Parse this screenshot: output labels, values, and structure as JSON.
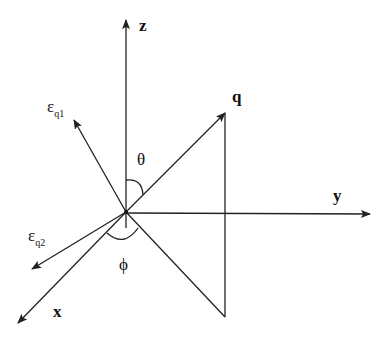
{
  "diagram": {
    "type": "3d-coordinate-vector-diagram",
    "axes": [
      {
        "id": "z",
        "label": "z"
      },
      {
        "id": "y",
        "label": "y"
      },
      {
        "id": "x",
        "label": "x"
      }
    ],
    "vectors": [
      {
        "id": "q",
        "label": "q"
      },
      {
        "id": "eps_q1",
        "symbol": "ε",
        "subscript": "q1"
      },
      {
        "id": "eps_q2",
        "symbol": "ε",
        "subscript": "q2"
      }
    ],
    "angles": [
      {
        "id": "theta",
        "label": "θ"
      },
      {
        "id": "phi",
        "label": "ϕ"
      }
    ],
    "colors": {
      "stroke": "#222222",
      "background": "#ffffff"
    }
  }
}
